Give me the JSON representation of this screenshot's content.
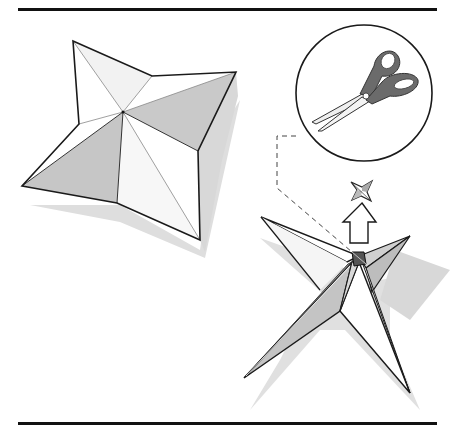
{
  "figure": {
    "colors": {
      "line": "#1a1a1a",
      "rule": "#111111",
      "paper_white": "#ffffff",
      "paper_light": "#f0f0f0",
      "paper_gray": "#c8c8c8",
      "shadow": "#dcdcdc",
      "handle": "#6b6b6b",
      "blade": "#efefef"
    },
    "elements": {
      "top_rule": "top-rule",
      "bottom_rule": "bottom-rule",
      "flat_star": "flat-star",
      "scissors_callout": "scissors-icon",
      "dashed_leader": "dashed-leader-line",
      "small_star": "small-star-icon",
      "up_arrow": "up-arrow-icon",
      "folded_star": "folded-star"
    }
  }
}
